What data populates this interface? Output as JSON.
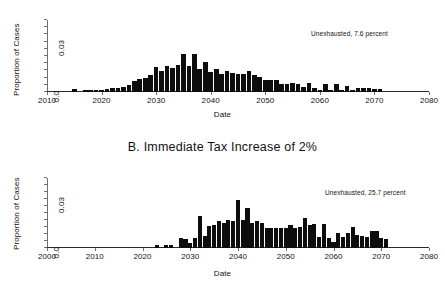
{
  "figure": {
    "background": "#ffffff",
    "bar_color": "#0d0d0d",
    "axis_color": "#6f6f6f"
  },
  "panel_a": {
    "title": "",
    "annotation": "Unexhausted, 7.6 percent",
    "xlabel": "Date",
    "ylabel": "Proportion of Cases",
    "ytick_labels": [
      "0.0",
      "0.03"
    ],
    "xtick_labels": [
      "2010",
      "2020",
      "2030",
      "2040",
      "2050",
      "2060",
      "2070",
      "2080"
    ]
  },
  "panel_b": {
    "title": "B.  Immediate Tax Increase of 2%",
    "annotation": "Unexhausted, 25.7 percent",
    "xlabel": "Date",
    "ylabel": "Proportion of Cases",
    "ytick_labels": [
      "0.0",
      "0.03"
    ],
    "xtick_labels": [
      "2000",
      "2010",
      "2020",
      "2030",
      "2040",
      "2050",
      "2060",
      "2070",
      "2080"
    ]
  },
  "chart_data": [
    {
      "id": "panel_a",
      "type": "bar",
      "title": "",
      "xlabel": "Date",
      "ylabel": "Proportion of Cases",
      "annotation": "Unexhausted, 7.6 percent",
      "xlim": [
        2010,
        2080
      ],
      "ylim": [
        0.0,
        0.042
      ],
      "xticks": [
        2010,
        2020,
        2030,
        2040,
        2050,
        2060,
        2070,
        2080
      ],
      "yticks": [
        0.0,
        0.03
      ],
      "ytick_labels": [
        "0.0",
        "0.03"
      ],
      "grid": false,
      "legend": "none",
      "bar_width_years": 1,
      "x": [
        2015,
        2016,
        2017,
        2018,
        2019,
        2020,
        2021,
        2022,
        2023,
        2024,
        2025,
        2026,
        2027,
        2028,
        2029,
        2030,
        2031,
        2032,
        2033,
        2034,
        2035,
        2036,
        2037,
        2038,
        2039,
        2040,
        2041,
        2042,
        2043,
        2044,
        2045,
        2046,
        2047,
        2048,
        2049,
        2050,
        2051,
        2052,
        2053,
        2054,
        2055,
        2056,
        2057,
        2058,
        2059,
        2060,
        2061,
        2062,
        2063,
        2064,
        2065,
        2066,
        2067,
        2068,
        2069,
        2070,
        2071
      ],
      "values": [
        0.002,
        0.0,
        0.0008,
        0.001,
        0.001,
        0.0012,
        0.0016,
        0.0022,
        0.0022,
        0.003,
        0.004,
        0.0062,
        0.0078,
        0.0082,
        0.0098,
        0.0148,
        0.012,
        0.015,
        0.014,
        0.016,
        0.0222,
        0.015,
        0.022,
        0.0132,
        0.0175,
        0.0118,
        0.0132,
        0.0106,
        0.012,
        0.011,
        0.0104,
        0.0104,
        0.0124,
        0.01,
        0.0086,
        0.0072,
        0.0072,
        0.007,
        0.0048,
        0.0048,
        0.005,
        0.0044,
        0.003,
        0.0054,
        0.0022,
        0.001,
        0.0044,
        0.001,
        0.0044,
        0.001,
        0.0034,
        0.001,
        0.0022,
        0.0022,
        0.0022,
        0.002,
        0.002
      ]
    },
    {
      "id": "panel_b",
      "type": "bar",
      "title": "B.  Immediate Tax Increase of 2%",
      "xlabel": "Date",
      "ylabel": "Proportion of Cases",
      "annotation": "Unexhausted, 25.7 percent",
      "xlim": [
        2000,
        2080
      ],
      "ylim": [
        0.0,
        0.042
      ],
      "xticks": [
        2000,
        2010,
        2020,
        2030,
        2040,
        2050,
        2060,
        2070,
        2080
      ],
      "yticks": [
        0.0,
        0.03
      ],
      "ytick_labels": [
        "0.0",
        "0.03"
      ],
      "grid": false,
      "legend": "none",
      "bar_width_years": 1,
      "x": [
        2023,
        2025,
        2026,
        2028,
        2029,
        2030,
        2031,
        2032,
        2033,
        2034,
        2035,
        2036,
        2037,
        2038,
        2039,
        2040,
        2041,
        2042,
        2043,
        2044,
        2045,
        2046,
        2047,
        2048,
        2049,
        2050,
        2051,
        2052,
        2053,
        2054,
        2055,
        2056,
        2057,
        2058,
        2059,
        2060,
        2061,
        2062,
        2063,
        2064,
        2065,
        2066,
        2067,
        2068,
        2069,
        2070,
        2071
      ],
      "values": [
        0.0018,
        0.0018,
        0.0018,
        0.006,
        0.0056,
        0.003,
        0.0062,
        0.019,
        0.0072,
        0.013,
        0.014,
        0.0164,
        0.015,
        0.017,
        0.016,
        0.029,
        0.0168,
        0.024,
        0.015,
        0.016,
        0.015,
        0.012,
        0.0118,
        0.0118,
        0.0118,
        0.0118,
        0.014,
        0.0118,
        0.0126,
        0.018,
        0.014,
        0.0142,
        0.0068,
        0.0142,
        0.0062,
        0.0034,
        0.009,
        0.0064,
        0.009,
        0.0128,
        0.0076,
        0.0074,
        0.0066,
        0.0104,
        0.0104,
        0.0058,
        0.0056
      ]
    }
  ]
}
